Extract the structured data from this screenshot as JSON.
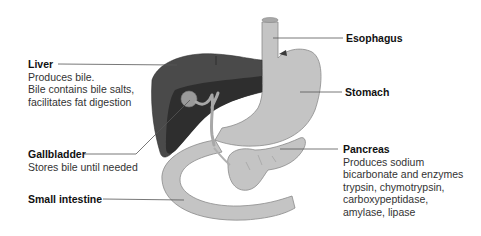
{
  "diagram": {
    "type": "digestive-organs-labeled",
    "colors": {
      "liver": "#4a4a4a",
      "liver_dark": "#2e2e2e",
      "gallbladder": "#9a9a9a",
      "organ_light": "#c4c4c4",
      "organ_outline": "#8a8a8a",
      "leader_line": "#555555",
      "text": "#1a1a1a"
    },
    "labels": {
      "liver": {
        "title": "Liver",
        "lines": [
          "Produces bile.",
          "Bile contains bile salts,",
          "facilitates fat digestion"
        ]
      },
      "gallbladder": {
        "title": "Gallbladder",
        "lines": [
          "Stores bile until needed"
        ]
      },
      "small_intestine": {
        "title": "Small intestine",
        "lines": []
      },
      "esophagus": {
        "title": "Esophagus",
        "lines": []
      },
      "stomach": {
        "title": "Stomach",
        "lines": []
      },
      "pancreas": {
        "title": "Pancreas",
        "lines": [
          "Produces sodium",
          "bicarbonate and enzymes",
          "trypsin, chymotrypsin,",
          "carboxypeptidase,",
          "amylase, lipase"
        ]
      }
    }
  }
}
